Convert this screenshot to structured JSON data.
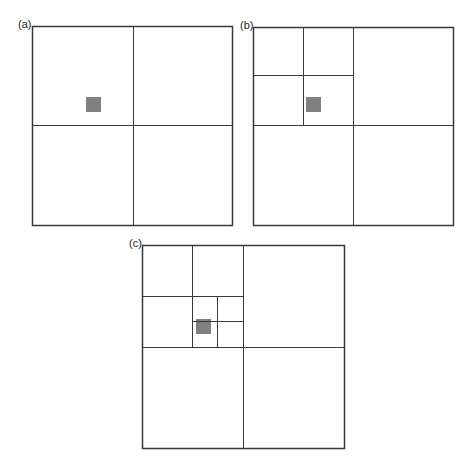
{
  "figure": {
    "colors": {
      "line": "#3a3a3a",
      "target": "#808080",
      "background": "#ffffff"
    },
    "panels": [
      {
        "label": "(a)",
        "box": {
          "x": 32,
          "y": 26,
          "w": 200,
          "h": 199
        },
        "lines": [
          {
            "x1": 133,
            "y1": 26,
            "x2": 133,
            "y2": 225
          },
          {
            "x1": 32,
            "y1": 125,
            "x2": 232,
            "y2": 125
          }
        ],
        "target": {
          "x": 86,
          "y": 97,
          "w": 15,
          "h": 15
        }
      },
      {
        "label": "(b)",
        "box": {
          "x": 253,
          "y": 27,
          "w": 200,
          "h": 198
        },
        "lines": [
          {
            "x1": 353,
            "y1": 27,
            "x2": 353,
            "y2": 225
          },
          {
            "x1": 253,
            "y1": 125,
            "x2": 453,
            "y2": 125
          },
          {
            "x1": 303,
            "y1": 27,
            "x2": 303,
            "y2": 125
          },
          {
            "x1": 253,
            "y1": 75,
            "x2": 353,
            "y2": 75
          }
        ],
        "target": {
          "x": 306,
          "y": 97,
          "w": 15,
          "h": 15
        }
      },
      {
        "label": "(c)",
        "box": {
          "x": 142,
          "y": 245,
          "w": 202,
          "h": 203
        },
        "lines": [
          {
            "x1": 243,
            "y1": 245,
            "x2": 243,
            "y2": 448
          },
          {
            "x1": 142,
            "y1": 347,
            "x2": 344,
            "y2": 347
          },
          {
            "x1": 192,
            "y1": 245,
            "x2": 192,
            "y2": 347
          },
          {
            "x1": 142,
            "y1": 296,
            "x2": 243,
            "y2": 296
          },
          {
            "x1": 217,
            "y1": 296,
            "x2": 217,
            "y2": 347
          },
          {
            "x1": 192,
            "y1": 321,
            "x2": 243,
            "y2": 321
          }
        ],
        "target": {
          "x": 196,
          "y": 319,
          "w": 15,
          "h": 15
        }
      }
    ]
  }
}
